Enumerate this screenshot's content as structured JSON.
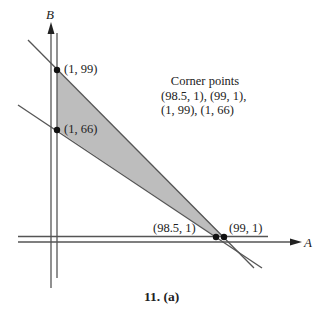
{
  "figure": {
    "axes": {
      "x_label": "A",
      "y_label": "B"
    },
    "points": [
      {
        "label": "(1, 99)",
        "A": 1,
        "B": 99
      },
      {
        "label": "(1, 66)",
        "A": 1,
        "B": 66
      },
      {
        "label": "(98.5, 1)",
        "A": 98.5,
        "B": 1
      },
      {
        "label": "(99, 1)",
        "A": 99,
        "B": 1
      }
    ],
    "note": {
      "title": "Corner points",
      "line1": "(98.5, 1), (99, 1),",
      "line2": "(1, 99), (1, 66)"
    },
    "caption": "11. (a)",
    "colors": {
      "region_fill": "#bdbdbd",
      "line": "#555555",
      "point": "#111111"
    }
  }
}
